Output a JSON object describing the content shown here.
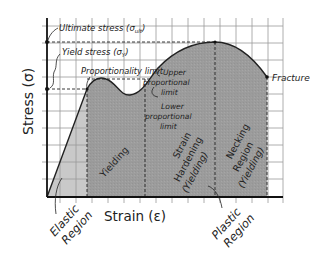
{
  "diagram": {
    "type": "stress-strain curve",
    "axes": {
      "y_label": "Stress (σ)",
      "x_label": "Strain (ε)"
    },
    "annotations": {
      "ultimate_stress": "Ultimate stress (σ",
      "ultimate_stress_sub": "ult",
      "yield_stress": "Yield stress (σ",
      "yield_stress_sub": "Y",
      "close_paren": ")",
      "proportionality_limit": "Proportionality limit",
      "upper_prop_1": "Upper",
      "upper_prop_2": "proportional",
      "upper_prop_3": "limit",
      "lower_prop_1": "Lower",
      "lower_prop_2": "proportional",
      "lower_prop_3": "limit",
      "fracture": "Fracture"
    },
    "regions": {
      "yielding": "Yielding",
      "strain_hardening_1": "Strain",
      "strain_hardening_2": "Hardening",
      "strain_hardening_3": "(Yielding)",
      "necking_1": "Necking",
      "necking_2": "Region",
      "necking_3": "(Yielding)",
      "elastic_1": "Elastic",
      "elastic_2": "Region",
      "plastic_1": "Plastic",
      "plastic_2": "Region"
    },
    "colors": {
      "elastic_fill": "#c8c8c8",
      "plastic_fill": "#9a9a9a",
      "grid": "#9a9a9a",
      "axis": "#111111",
      "curve": "#222222"
    }
  }
}
